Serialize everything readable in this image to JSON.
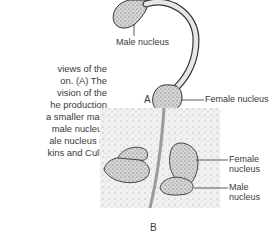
{
  "caption": {
    "lines": [
      "views of the",
      "on.  (A)  The",
      "vision  of  the",
      "he production",
      "a smaller male",
      "male nucleus",
      "ale nucleus of",
      "kins and Cull.)"
    ]
  },
  "figure": {
    "panel_a": {
      "letter": "A",
      "labels": {
        "male_nucleus": "Male nucleus",
        "female_nucleus": "Female nucleus"
      }
    },
    "panel_b": {
      "letter": "B",
      "labels": {
        "female_nucleus_line1": "Female",
        "female_nucleus_line2": "nucleus",
        "male_nucleus_line1": "Male",
        "male_nucleus_line2": "nucleus"
      }
    }
  }
}
